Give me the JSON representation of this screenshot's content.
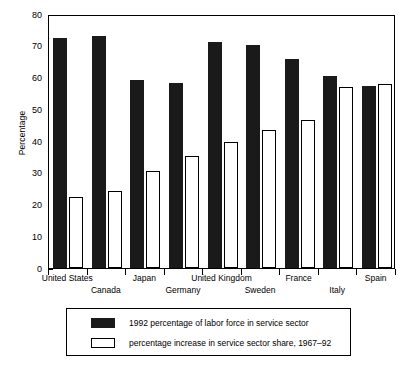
{
  "chart_data": {
    "type": "bar",
    "title": "",
    "xlabel": "",
    "ylabel": "Percentage",
    "ylim": [
      0,
      80
    ],
    "yticks": [
      0,
      10,
      20,
      30,
      40,
      50,
      60,
      70,
      80
    ],
    "grid": false,
    "legend_position": "bottom",
    "categories": [
      "United States",
      "Canada",
      "Japan",
      "Germany",
      "United Kingdom",
      "Sweden",
      "France",
      "Italy",
      "Spain"
    ],
    "series": [
      {
        "name": "1992 percentage of labor force in service sector",
        "color": "#1a1a1a",
        "values": [
          72.3,
          73.0,
          59.2,
          58.2,
          71.2,
          70.2,
          65.8,
          60.4,
          57.3
        ]
      },
      {
        "name": "percentage increase in service sector share, 1967–92",
        "color": "#ffffff",
        "values": [
          22.5,
          24.2,
          30.6,
          35.3,
          39.8,
          43.5,
          46.5,
          57.0,
          57.9
        ]
      }
    ]
  },
  "axis": {
    "ylabel": "Percentage",
    "ytick_labels": [
      "80",
      "70",
      "60",
      "50",
      "40",
      "30",
      "20",
      "10",
      "0"
    ]
  },
  "legend": {
    "items": [
      {
        "swatch": "dark-filled-swatch",
        "label": "1992 percentage of labor force in service sector"
      },
      {
        "swatch": "white-outlined-swatch",
        "label": "percentage increase in service sector share, 1967–92"
      }
    ]
  }
}
